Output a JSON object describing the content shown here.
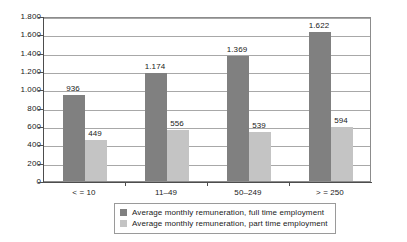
{
  "chart_data": {
    "type": "bar",
    "title": "",
    "subtitle": "",
    "xlabel": "",
    "ylabel": "",
    "categories": [
      "< = 10",
      "11–49",
      "50–249",
      "> = 250"
    ],
    "series": [
      {
        "name": "Average monthly remuneration, full time employment",
        "color": "#808080",
        "values": [
          936,
          1174,
          1369,
          1622
        ],
        "labels": [
          "936",
          "1.174",
          "1.369",
          "1.622"
        ]
      },
      {
        "name": "Average monthly remuneration, part time employment",
        "color": "#c4c4c4",
        "values": [
          449,
          556,
          539,
          594
        ],
        "labels": [
          "449",
          "556",
          "539",
          "594"
        ]
      }
    ],
    "ylim": [
      0,
      1800
    ],
    "ytick_values": [
      0,
      200,
      400,
      600,
      800,
      1000,
      1200,
      1400,
      1600,
      1800
    ],
    "ytick_labels": [
      "0",
      "200",
      "400",
      "600",
      "800",
      "1.000",
      "1.200",
      "1.400",
      "1.600",
      "1.800"
    ],
    "grid": true,
    "grid_axis": "y",
    "legend_position": "bottom",
    "thousands_separator": "."
  },
  "legend": {
    "items": [
      {
        "label": "Average monthly remuneration, full time employment",
        "color": "#808080"
      },
      {
        "label": "Average monthly remuneration, part time employment",
        "color": "#c4c4c4"
      }
    ]
  }
}
